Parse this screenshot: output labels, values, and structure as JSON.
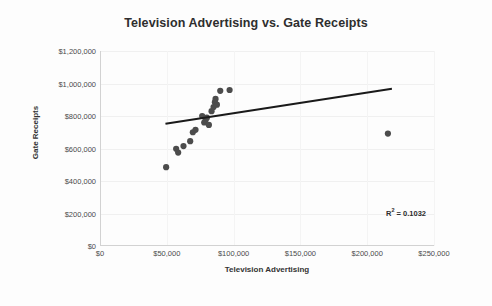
{
  "chart_data": {
    "type": "scatter",
    "title": "Television Advertising vs. Gate Receipts",
    "xlabel": "Television Advertising",
    "ylabel": "Gate Receipts",
    "xlim": [
      0,
      250000
    ],
    "ylim": [
      0,
      1200000
    ],
    "xticks": [
      0,
      50000,
      100000,
      150000,
      200000,
      250000
    ],
    "yticks": [
      0,
      200000,
      400000,
      600000,
      800000,
      1000000,
      1200000
    ],
    "xtick_labels": [
      "$0",
      "$50,000",
      "$100,000",
      "$150,000",
      "$200,000",
      "$250,000"
    ],
    "ytick_labels": [
      "$0",
      "$200,000",
      "$400,000",
      "$600,000",
      "$800,000",
      "$1,000,000",
      "$1,200,000"
    ],
    "grid": true,
    "legend": false,
    "point_color": "#4c4c4c",
    "trendline_color": "#1a1a1a",
    "points": [
      {
        "x": 49500,
        "y": 485000
      },
      {
        "x": 57000,
        "y": 598000
      },
      {
        "x": 58500,
        "y": 575000
      },
      {
        "x": 62500,
        "y": 615000
      },
      {
        "x": 67500,
        "y": 645000
      },
      {
        "x": 69500,
        "y": 700000
      },
      {
        "x": 71500,
        "y": 715000
      },
      {
        "x": 76500,
        "y": 800000
      },
      {
        "x": 78000,
        "y": 760000
      },
      {
        "x": 79000,
        "y": 775000
      },
      {
        "x": 80000,
        "y": 790000
      },
      {
        "x": 81500,
        "y": 745000
      },
      {
        "x": 83500,
        "y": 830000
      },
      {
        "x": 85000,
        "y": 855000
      },
      {
        "x": 86000,
        "y": 885000
      },
      {
        "x": 86500,
        "y": 905000
      },
      {
        "x": 87500,
        "y": 870000
      },
      {
        "x": 90000,
        "y": 955000
      },
      {
        "x": 97000,
        "y": 960000
      },
      {
        "x": 215500,
        "y": 692000
      }
    ],
    "trendline": {
      "x_start": 49000,
      "y_start": 752000,
      "x_end": 218500,
      "y_end": 968000
    },
    "annotations": [
      {
        "name": "r-squared",
        "text_prefix": "R",
        "text_sup": "2",
        "text_suffix": " = 0.1032",
        "value": 0.1032
      }
    ]
  },
  "title": "Television Advertising vs. Gate Receipts",
  "axes": {
    "y_title": "Gate Receipts",
    "x_title": "Television Advertising"
  },
  "r_squared": {
    "prefix": "R",
    "sup": "2",
    "suffix": " = 0.1032"
  }
}
